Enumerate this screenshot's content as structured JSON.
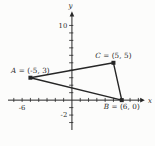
{
  "window": {
    "width": 155,
    "height": 146,
    "background": "#fcfcfb",
    "ink": "#262626"
  },
  "chart_data": {
    "type": "scatter",
    "title": "",
    "xlabel": "x",
    "ylabel": "y",
    "points": [
      {
        "name": "A",
        "x": -5,
        "y": 3,
        "label": "A = (-5, 3)",
        "label_position": "above"
      },
      {
        "name": "C",
        "x": 5,
        "y": 5,
        "label": "C = (5, 5)",
        "label_position": "above"
      },
      {
        "name": "B",
        "x": 6,
        "y": 0,
        "label": "B = (6, 0)",
        "label_position": "below"
      }
    ],
    "polygon": {
      "vertices": [
        "A",
        "C",
        "B"
      ],
      "closed": true
    },
    "axes": {
      "xlim": [
        -7.7,
        8.8
      ],
      "ylim": [
        -4,
        11.8
      ],
      "x_ticks": [
        -7,
        -6,
        -5,
        -4,
        -3,
        -2,
        -1,
        1,
        2,
        3,
        4,
        5,
        6,
        7,
        8
      ],
      "y_ticks": [
        -3,
        -2,
        -1,
        1,
        2,
        3,
        4,
        5,
        6,
        7,
        8,
        9,
        10
      ],
      "x_tick_labels": [
        {
          "value": -6,
          "text": "-6"
        }
      ],
      "y_tick_labels": [
        {
          "value": 10,
          "text": "10"
        },
        {
          "value": -2,
          "text": "-2"
        }
      ],
      "grid": false,
      "legend_position": "none"
    }
  }
}
